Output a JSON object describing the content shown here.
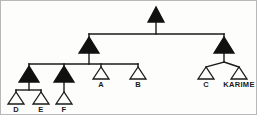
{
  "figure": {
    "background_color": "#fdfdfc",
    "border_color": "#b8b8b8",
    "line_color": "#1a1a1a",
    "filled_node_color": "#111111",
    "open_node_fill": "#fdfdfc"
  },
  "tree": {
    "root": {
      "id": "root",
      "shape": "triangle",
      "filled": true,
      "label": "",
      "x": 155,
      "y": 12
    },
    "nodes": [
      {
        "id": "n-left",
        "shape": "triangle",
        "filled": true,
        "label": "",
        "x": 88,
        "y": 43,
        "level": 2
      },
      {
        "id": "n-right",
        "shape": "triangle",
        "filled": true,
        "label": "",
        "x": 223,
        "y": 43,
        "level": 2
      },
      {
        "id": "n-de",
        "shape": "triangle",
        "filled": true,
        "label": "",
        "x": 28,
        "y": 72,
        "level": 3
      },
      {
        "id": "n-f",
        "shape": "triangle",
        "filled": true,
        "label": "",
        "x": 63,
        "y": 72,
        "level": 3
      },
      {
        "id": "leaf-a",
        "shape": "triangle",
        "filled": false,
        "label": "A",
        "x": 100,
        "y": 73,
        "level": 3
      },
      {
        "id": "leaf-b",
        "shape": "triangle",
        "filled": false,
        "label": "B",
        "x": 137,
        "y": 73,
        "level": 3
      },
      {
        "id": "leaf-c",
        "shape": "triangle",
        "filled": false,
        "label": "C",
        "x": 205,
        "y": 73,
        "level": 3
      },
      {
        "id": "leaf-karime",
        "shape": "triangle",
        "filled": false,
        "label": "KARIME",
        "x": 238,
        "y": 73,
        "level": 3
      },
      {
        "id": "leaf-d",
        "shape": "triangle",
        "filled": false,
        "label": "D",
        "x": 15,
        "y": 98,
        "level": 4
      },
      {
        "id": "leaf-e",
        "shape": "triangle",
        "filled": false,
        "label": "E",
        "x": 40,
        "y": 98,
        "level": 4
      },
      {
        "id": "leaf-f",
        "shape": "triangle",
        "filled": false,
        "label": "F",
        "x": 63,
        "y": 98,
        "level": 4
      }
    ],
    "labels": {
      "a": "A",
      "b": "B",
      "c": "C",
      "karime": "KARIME",
      "d": "D",
      "e": "E",
      "f": "F"
    }
  }
}
